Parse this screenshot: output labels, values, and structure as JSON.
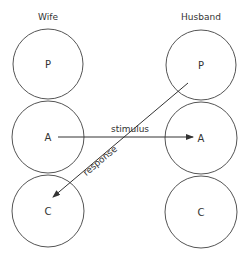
{
  "diagram": {
    "type": "transactional-analysis-crossed-transaction",
    "columns": [
      {
        "label": "Wife",
        "states": [
          {
            "label": "P",
            "meaning": "Parent"
          },
          {
            "label": "A",
            "meaning": "Adult"
          },
          {
            "label": "C",
            "meaning": "Child"
          }
        ]
      },
      {
        "label": "Husband",
        "states": [
          {
            "label": "P",
            "meaning": "Parent"
          },
          {
            "label": "A",
            "meaning": "Adult"
          },
          {
            "label": "C",
            "meaning": "Child"
          }
        ]
      }
    ],
    "arrows": [
      {
        "label": "stimulus",
        "from": "Wife.A",
        "to": "Husband.A"
      },
      {
        "label": "response",
        "from": "Husband.P",
        "to": "Wife.C"
      }
    ]
  },
  "colors": {
    "stroke": "#555555",
    "text": "#333333",
    "background": "#ffffff"
  }
}
